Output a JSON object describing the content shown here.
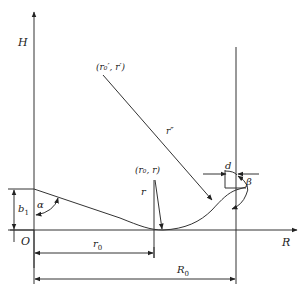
{
  "figure": {
    "axes": {
      "vertical_label": "H",
      "horizontal_label": "R",
      "origin_label": "O"
    },
    "labels": {
      "point_prime": "(r₀′, r′)",
      "point": "(r₀, r)",
      "radius_r": "r",
      "radius_r_double_prime": "r″",
      "angle_alpha": "α",
      "angle_beta": "β",
      "height_b1": "b",
      "height_b1_sub": "1",
      "width_d": "d",
      "dim_r0": "r",
      "dim_r0_sub": "0",
      "dim_R0": "R",
      "dim_R0_sub": "0"
    },
    "colors": {
      "line": "#333333",
      "text": "#222222"
    }
  }
}
